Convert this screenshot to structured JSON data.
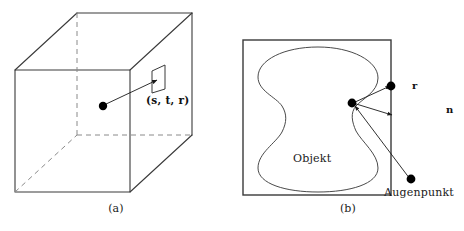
{
  "figure": {
    "panels": [
      {
        "id": "a",
        "caption": "(a)",
        "type": "cube-3d-texture",
        "labels": {
          "texture_coords": "(s, t, r)"
        }
      },
      {
        "id": "b",
        "caption": "(b)",
        "type": "ray-object-intersection",
        "labels": {
          "texture_coords": "(s, t, r)",
          "reflection_vector": "r",
          "normal_vector": "n",
          "object": "Objekt",
          "eye_point": "Augenpunkt"
        }
      }
    ],
    "colors": {
      "stroke": "#3a3a3a",
      "dashed_stroke": "#8a8a8a",
      "text": "#1a1a1a",
      "dot_fill": "#000000",
      "background": "#ffffff"
    }
  }
}
